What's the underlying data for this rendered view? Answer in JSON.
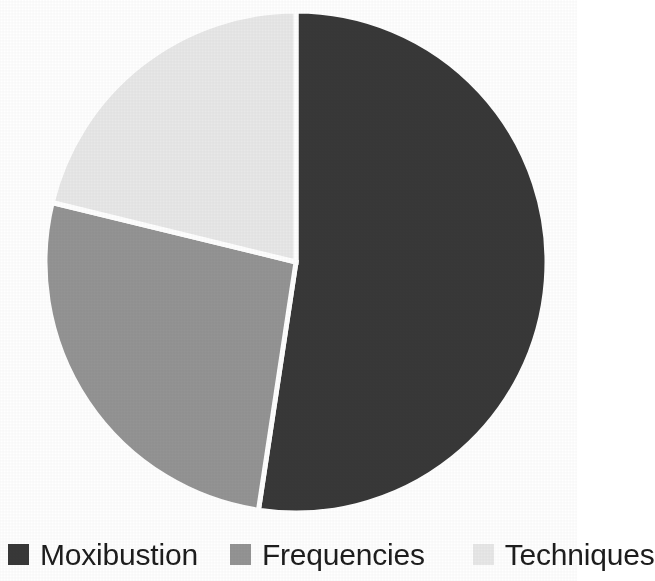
{
  "chart_data": {
    "type": "pie",
    "title": "",
    "subtitle": "",
    "xlabel": "",
    "ylabel": "",
    "grid": false,
    "legend_position": "bottom",
    "start_angle_deg": 0,
    "direction": "clockwise",
    "categories": [
      "Moxibustion",
      "Frequencies",
      "Techniques"
    ],
    "values": [
      52.4,
      26.4,
      21.2
    ],
    "value_unit": "percent",
    "angles_deg": [
      188.6,
      95.1,
      76.3
    ],
    "colors": [
      "#383838",
      "#949494",
      "#e8e8e8"
    ],
    "separator_color": "#ffffff",
    "slices": [
      {
        "label": "Moxibustion",
        "value": 52.4,
        "angle_deg": 188.6,
        "color": "#383838"
      },
      {
        "label": "Frequencies",
        "value": 26.4,
        "angle_deg": 95.1,
        "color": "#949494"
      },
      {
        "label": "Techniques",
        "value": 21.2,
        "angle_deg": 76.3,
        "color": "#e8e8e8"
      }
    ],
    "geometry": {
      "center_x": 296,
      "center_y": 262,
      "radius": 251
    }
  },
  "legend": {
    "entries": [
      {
        "label": "Moxibustion",
        "color": "#383838"
      },
      {
        "label": "Frequencies",
        "color": "#949494"
      },
      {
        "label": "Techniques",
        "color": "#e8e8e8"
      }
    ]
  },
  "colors": {
    "background": "#ffffff",
    "text": "#1d1d1d",
    "slice_dark": "#383838",
    "slice_medium": "#949494",
    "slice_light": "#e8e8e8",
    "separator": "#ffffff"
  }
}
